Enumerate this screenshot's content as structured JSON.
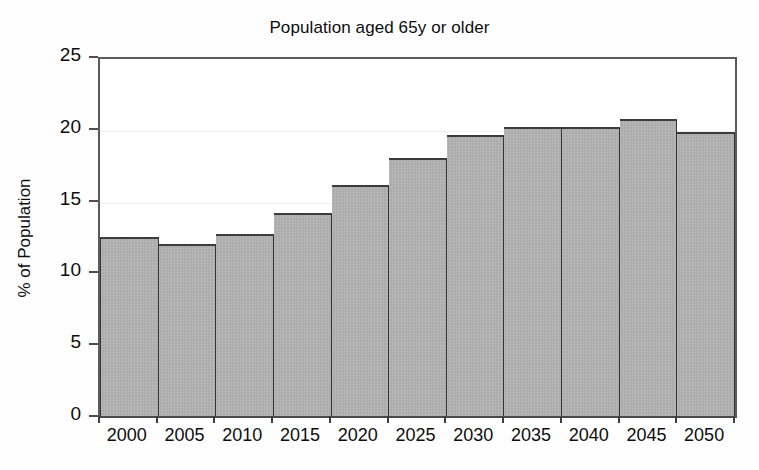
{
  "chart_data": {
    "type": "bar",
    "title": "Population aged 65y or older",
    "xlabel": "",
    "ylabel": "% of Population",
    "categories": [
      "2000",
      "2005",
      "2010",
      "2015",
      "2020",
      "2025",
      "2030",
      "2035",
      "2040",
      "2045",
      "2050"
    ],
    "values": [
      12.6,
      12.1,
      12.8,
      14.3,
      16.2,
      18.1,
      19.7,
      20.3,
      20.3,
      20.8,
      19.9
    ],
    "ylim": [
      0,
      25
    ],
    "ytick_labels": [
      "0",
      "5",
      "10",
      "15",
      "20",
      "25"
    ],
    "ytick_values": [
      0,
      5,
      10,
      15,
      20,
      25
    ],
    "grid": true,
    "legend": "none",
    "bar_fill_color": "#b2b2b2",
    "bar_edge_color": "#3c3c3c",
    "axis_color": "#4f4f4f",
    "background_color": "#ffffff",
    "text_color": "#0d0d0d"
  }
}
